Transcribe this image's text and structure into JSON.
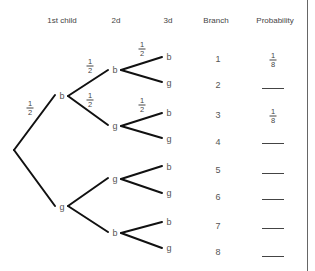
{
  "headers": {
    "first": "1st child",
    "second": "2d",
    "third": "3d",
    "branch": "Branch",
    "probability": "Probability"
  },
  "tree": {
    "level1": [
      {
        "label": "b",
        "prob_num": "1",
        "prob_den": "2"
      },
      {
        "label": "g"
      }
    ],
    "level2": [
      {
        "label": "b",
        "prob_num": "1",
        "prob_den": "2"
      },
      {
        "label": "g",
        "prob_num": "1",
        "prob_den": "2"
      },
      {
        "label": "g"
      },
      {
        "label": "b"
      }
    ],
    "level3": [
      {
        "label": "b",
        "prob_num": "1",
        "prob_den": "2"
      },
      {
        "label": "g"
      },
      {
        "label": "b",
        "prob_num": "1",
        "prob_den": "2"
      },
      {
        "label": "g"
      },
      {
        "label": "b"
      },
      {
        "label": "g"
      },
      {
        "label": "b"
      },
      {
        "label": "g"
      }
    ]
  },
  "branches": [
    {
      "number": "1",
      "prob_num": "1",
      "prob_den": "8",
      "blank": false
    },
    {
      "number": "2",
      "blank": true
    },
    {
      "number": "3",
      "prob_num": "1",
      "prob_den": "8",
      "blank": false
    },
    {
      "number": "4",
      "blank": true
    },
    {
      "number": "5",
      "blank": true
    },
    {
      "number": "6",
      "blank": true
    },
    {
      "number": "7",
      "blank": true
    },
    {
      "number": "8",
      "blank": true
    }
  ],
  "colors": {
    "line": "#111111",
    "text": "#555555"
  }
}
